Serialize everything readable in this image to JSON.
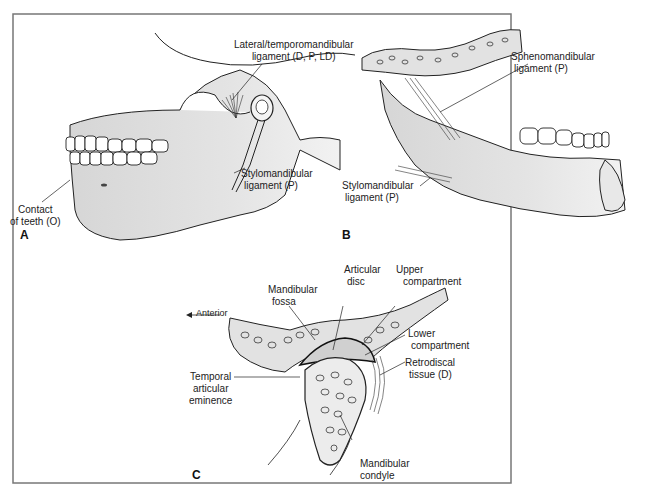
{
  "figure": {
    "panels": [
      {
        "id": "A",
        "label": "A",
        "annotations": [
          {
            "key": "lateral",
            "line1": "Lateral/temporomandibular",
            "line2": "ligament (D, P, LD)"
          },
          {
            "key": "contact",
            "line1": "Contact",
            "line2": "of teeth (O)"
          },
          {
            "key": "stylo",
            "line1": "Stylomandibular",
            "line2": "ligament (P)"
          }
        ]
      },
      {
        "id": "B",
        "label": "B",
        "annotations": [
          {
            "key": "spheno",
            "line1": "Sphenomandibular",
            "line2": "ligament (P)"
          },
          {
            "key": "stylo",
            "line1": "Stylomandibular",
            "line2": "ligament (P)"
          }
        ]
      },
      {
        "id": "C",
        "label": "C",
        "annotations": [
          {
            "key": "anterior",
            "line1": "Anterior",
            "line2": ""
          },
          {
            "key": "fossa",
            "line1": "Mandibular",
            "line2": "fossa"
          },
          {
            "key": "disc",
            "line1": "Articular",
            "line2": "disc"
          },
          {
            "key": "upper",
            "line1": "Upper",
            "line2": "compartment"
          },
          {
            "key": "lower",
            "line1": "Lower",
            "line2": "compartment"
          },
          {
            "key": "retro",
            "line1": "Retrodiscal",
            "line2": "tissue (D)"
          },
          {
            "key": "eminence",
            "line1": "Temporal",
            "line2": "articular",
            "line3": "eminence"
          },
          {
            "key": "condyle",
            "line1": "Mandibular",
            "line2": "condyle"
          }
        ]
      }
    ]
  }
}
